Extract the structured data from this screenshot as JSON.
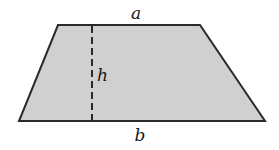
{
  "diagram": {
    "type": "geometry",
    "shape": "trapezoid",
    "fill_color": "#d0d0d0",
    "stroke_color": "#2a2a2a",
    "vertices": {
      "top_left": [
        58,
        25
      ],
      "top_right": [
        200,
        25
      ],
      "bottom_right": [
        265,
        121
      ],
      "bottom_left": [
        19,
        121
      ]
    },
    "height_line": {
      "x": 92,
      "y_top": 25,
      "y_bottom": 121,
      "style": "dashed"
    },
    "labels": {
      "top_base": "a",
      "height": "h",
      "bottom_base": "b"
    }
  }
}
